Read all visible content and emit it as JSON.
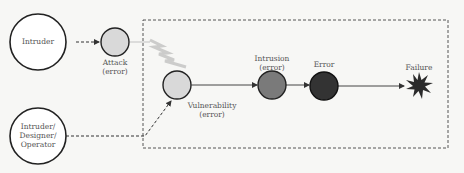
{
  "diagram": {
    "title": "",
    "nodes": {
      "intruder": {
        "label": "Intruder",
        "shape": "circle",
        "fill": "#ffffff"
      },
      "intruder_designer_operator": {
        "label": "Intruder/\nDesigner/\nOperator",
        "shape": "circle",
        "fill": "#ffffff"
      },
      "attack": {
        "label": "Attack\n(error)",
        "shape": "circle",
        "fill": "#d9d9d9"
      },
      "vulnerability": {
        "label": "Vulnerability\n(error)",
        "shape": "circle",
        "fill": "#d9d9d9"
      },
      "intrusion": {
        "label": "Intrusion\n(error)",
        "shape": "circle",
        "fill": "#7a7a7a"
      },
      "error": {
        "label": "Error",
        "shape": "circle",
        "fill": "#333333"
      },
      "failure": {
        "label": "Failure",
        "shape": "star",
        "fill": "#2b2b2b"
      }
    },
    "edges": [
      {
        "from": "intruder",
        "to": "attack",
        "style": "dashed-arrow"
      },
      {
        "from": "attack",
        "to": "vulnerability",
        "style": "lightning"
      },
      {
        "from": "intruder_designer_operator",
        "to": "vulnerability",
        "style": "dashed-arrow"
      },
      {
        "from": "vulnerability",
        "to": "intrusion",
        "style": "solid-arrow"
      },
      {
        "from": "intrusion",
        "to": "error",
        "style": "solid-arrow"
      },
      {
        "from": "error",
        "to": "failure",
        "style": "solid-arrow"
      }
    ],
    "system_boundary": {
      "style": "dashed-rectangle"
    }
  }
}
